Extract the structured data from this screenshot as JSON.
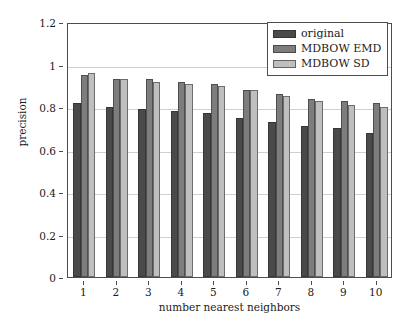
{
  "chart_data": {
    "type": "bar",
    "title": "",
    "xlabel": "number nearest neighbors",
    "ylabel": "precision",
    "categories": [
      "1",
      "2",
      "3",
      "4",
      "5",
      "6",
      "7",
      "8",
      "9",
      "10"
    ],
    "series": [
      {
        "name": "original",
        "color": "#4a4a4a",
        "values": [
          0.82,
          0.8,
          0.79,
          0.78,
          0.77,
          0.75,
          0.73,
          0.71,
          0.7,
          0.68
        ]
      },
      {
        "name": "MDBOW EMD",
        "color": "#7d7d7d",
        "values": [
          0.95,
          0.93,
          0.93,
          0.92,
          0.91,
          0.88,
          0.86,
          0.84,
          0.83,
          0.82
        ]
      },
      {
        "name": "MDBOW SD",
        "color": "#bfbfbf",
        "values": [
          0.96,
          0.93,
          0.92,
          0.91,
          0.9,
          0.88,
          0.85,
          0.83,
          0.81,
          0.8
        ]
      }
    ],
    "ylim": [
      0,
      1.2
    ],
    "yticks": [
      "0",
      "0.2",
      "0.4",
      "0.6",
      "0.8",
      "1",
      "1.2"
    ],
    "ytick_values": [
      0,
      0.2,
      0.4,
      0.6,
      0.8,
      1,
      1.2
    ],
    "grid": "horizontal",
    "legend_position": "top-right"
  },
  "legend": {
    "entries": [
      {
        "label": "original",
        "color": "#4a4a4a"
      },
      {
        "label": "MDBOW EMD",
        "color": "#7d7d7d"
      },
      {
        "label": "MDBOW SD",
        "color": "#bfbfbf"
      }
    ]
  }
}
